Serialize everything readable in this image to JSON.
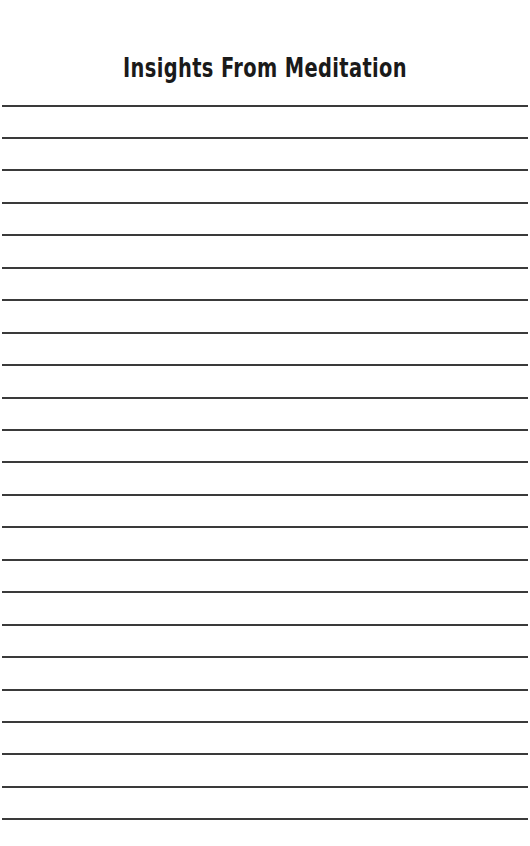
{
  "page": {
    "title": "Insights From Meditation",
    "line_color": "#3a3a3a",
    "line_count": 23,
    "line_positions": [
      106,
      138,
      170,
      203,
      235,
      268,
      300,
      333,
      365,
      398,
      430,
      462,
      495,
      527,
      560,
      592,
      625,
      657,
      690,
      722,
      754,
      787,
      819
    ]
  }
}
